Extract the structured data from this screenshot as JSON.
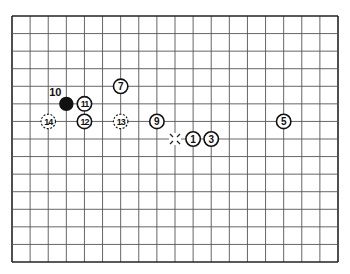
{
  "diagram": {
    "type": "go-board-fragment",
    "grid": {
      "left": 12,
      "top": 16,
      "right": 338,
      "bottom": 262,
      "cols": 18,
      "rows": 14,
      "line_color": "#555555",
      "border_color": "#222222"
    },
    "stones": [
      {
        "label": "1",
        "col": 10,
        "row": 7,
        "style": "white"
      },
      {
        "label": "3",
        "col": 11,
        "row": 7,
        "style": "white"
      },
      {
        "label": "5",
        "col": 15,
        "row": 6,
        "style": "white"
      },
      {
        "label": "7",
        "col": 6,
        "row": 4,
        "style": "white"
      },
      {
        "label": "9",
        "col": 8,
        "row": 6,
        "style": "white"
      },
      {
        "label": "10",
        "col": 3,
        "row": 5,
        "style": "black",
        "label_offset": "upper-left"
      },
      {
        "label": "11",
        "col": 4,
        "row": 5,
        "style": "white"
      },
      {
        "label": "12",
        "col": 4,
        "row": 6,
        "style": "white"
      },
      {
        "label": "13",
        "col": 6,
        "row": 6,
        "style": "dashed"
      },
      {
        "label": "14",
        "col": 2,
        "row": 6,
        "style": "dashed"
      }
    ],
    "markers": [
      {
        "type": "x-mark",
        "col": 9,
        "row": 7
      }
    ]
  }
}
